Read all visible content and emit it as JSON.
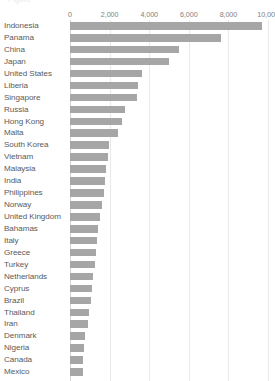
{
  "title_fragment": "Figure",
  "chart_data": {
    "type": "bar",
    "orientation": "horizontal",
    "title": "",
    "subtitle": "",
    "xlabel": "",
    "ylabel": "",
    "xlim": [
      0,
      10000
    ],
    "grid": true,
    "legend": false,
    "axis_position": "top",
    "bar_color": "#a6a6a6",
    "gridline_color": "#e9e9e9",
    "label_color": "#5a5a5a",
    "tick_labels": [
      "0",
      "2,000",
      "4,000",
      "6,000",
      "8,000",
      "10,000"
    ],
    "tick_values": [
      0,
      2000,
      4000,
      6000,
      8000,
      10000
    ],
    "categories": [
      "Indonesia",
      "Panama",
      "China",
      "Japan",
      "United States",
      "Liberia",
      "Singapore",
      "Russia",
      "Hong Kong",
      "Malta",
      "South Korea",
      "Vietnam",
      "Malaysia",
      "India",
      "Philippines",
      "Norway",
      "United Kingdom",
      "Bahamas",
      "Italy",
      "Greece",
      "Turkey",
      "Netherlands",
      "Cyprus",
      "Brazil",
      "Thailand",
      "Iran",
      "Denmark",
      "Nigeria",
      "Canada",
      "Mexico"
    ],
    "values": [
      9700,
      7650,
      5500,
      5000,
      3650,
      3450,
      3400,
      2800,
      2650,
      2400,
      1950,
      1900,
      1800,
      1750,
      1700,
      1600,
      1500,
      1400,
      1350,
      1300,
      1250,
      1150,
      1100,
      1050,
      950,
      900,
      750,
      700,
      680,
      650
    ]
  }
}
